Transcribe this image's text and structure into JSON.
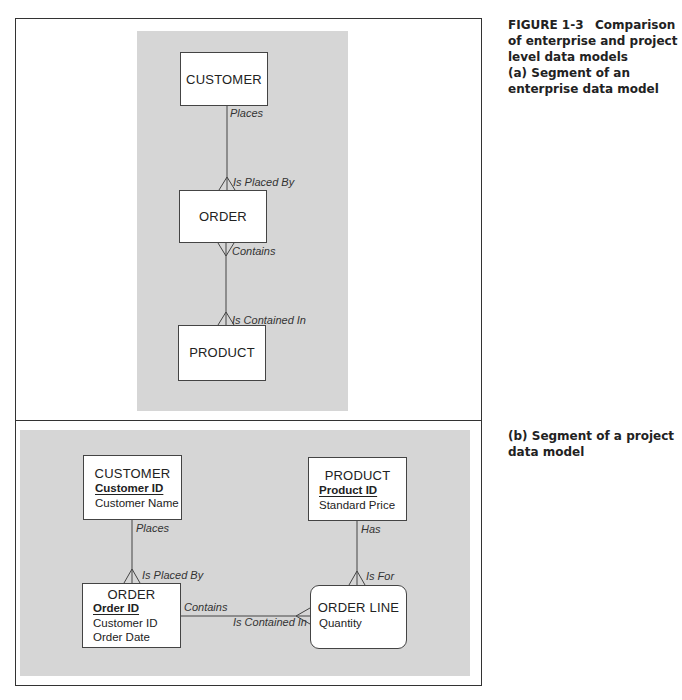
{
  "caption_a": {
    "figure_label": "FIGURE 1-3",
    "title": "Comparison of enterprise and project level data models",
    "subtitle": "(a) Segment of an enterprise data model"
  },
  "caption_b": {
    "subtitle": "(b) Segment of a project data model"
  },
  "enterprise_model": {
    "entities": [
      {
        "name": "CUSTOMER"
      },
      {
        "name": "ORDER"
      },
      {
        "name": "PRODUCT"
      }
    ],
    "relationships": [
      {
        "from": "CUSTOMER",
        "to": "ORDER",
        "label_forward": "Places",
        "label_reverse": "Is Placed By"
      },
      {
        "from": "ORDER",
        "to": "PRODUCT",
        "label_forward": "Contains",
        "label_reverse": "Is Contained In"
      }
    ]
  },
  "project_model": {
    "entities": [
      {
        "name": "CUSTOMER",
        "key": "Customer ID",
        "attributes": [
          "Customer Name"
        ]
      },
      {
        "name": "PRODUCT",
        "key": "Product ID",
        "attributes": [
          "Standard Price"
        ]
      },
      {
        "name": "ORDER",
        "key": "Order ID",
        "attributes": [
          "Customer ID",
          "Order Date"
        ]
      },
      {
        "name": "ORDER LINE",
        "key": "",
        "attributes": [
          "Quantity"
        ]
      }
    ],
    "relationships": [
      {
        "from": "CUSTOMER",
        "to": "ORDER",
        "label_forward": "Places",
        "label_reverse": "Is Placed By"
      },
      {
        "from": "PRODUCT",
        "to": "ORDER LINE",
        "label_forward": "Has",
        "label_reverse": "Is For"
      },
      {
        "from": "ORDER",
        "to": "ORDER LINE",
        "label_forward": "Contains",
        "label_reverse": "Is Contained In"
      }
    ]
  },
  "colors": {
    "panel_background": "#d6d6d6",
    "entity_fill": "#ffffff",
    "line": "#444444"
  }
}
